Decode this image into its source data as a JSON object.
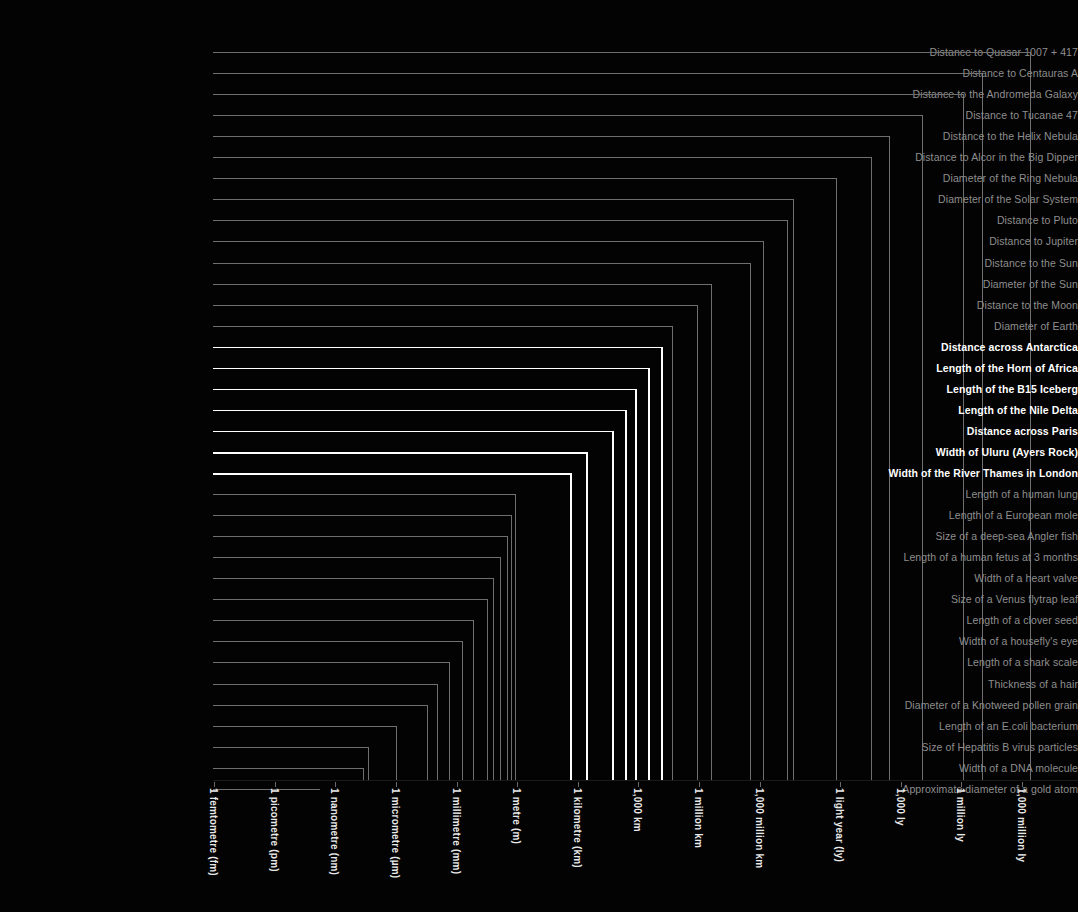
{
  "meta": {
    "background_color": "#000000",
    "dim_color": "#8e8e8e",
    "bold_color": "#ffffff"
  },
  "chart_data": {
    "type": "bar",
    "orientation": "vertical-dropline",
    "title": "",
    "subtitle": "",
    "xlabel": "",
    "ylabel": "",
    "scale": "log10",
    "grid": false,
    "legend_position": "none",
    "axis_ticks": [
      {
        "label": "1 femtometre (fm)",
        "exponent": -15
      },
      {
        "label": "1 picometre (pm)",
        "exponent": -12
      },
      {
        "label": "1 nanometre (nm)",
        "exponent": -9
      },
      {
        "label": "1 micrometre (µm)",
        "exponent": -6
      },
      {
        "label": "1 millimetre (mm)",
        "exponent": -3
      },
      {
        "label": "1 metre (m)",
        "exponent": 0
      },
      {
        "label": "1 kilometre (km)",
        "exponent": 3
      },
      {
        "label": "1,000 km",
        "exponent": 6
      },
      {
        "label": "1 million km",
        "exponent": 9
      },
      {
        "label": "1,000 million km",
        "exponent": 12
      },
      {
        "label": "1 light year (ly)",
        "exponent": 15.98
      },
      {
        "label": "1,000 ly",
        "exponent": 18.98
      },
      {
        "label": "1 million ly",
        "exponent": 21.98
      },
      {
        "label": "1,000 million ly",
        "exponent": 24.98
      }
    ],
    "categories": [
      "Distance to Quasar 1007 + 417",
      "Distance to Centauras A",
      "Distance to the Andromeda Galaxy",
      "Distance to Tucanae 47",
      "Distance to the Helix Nebula",
      "Distance to Alcor in the Big Dipper",
      "Diameter of the Ring Nebula",
      "Diameter of the Solar System",
      "Distance to Pluto",
      "Distance to Jupiter",
      "Distance to the Sun",
      "Diameter of the Sun",
      "Distance to the Moon",
      "Diameter of Earth",
      "Distance across Antarctica",
      "Length of the Horn of Africa",
      "Length of the B15 Iceberg",
      "Length of the Nile Delta",
      "Distance across Paris",
      "Width of Uluru (Ayers Rock)",
      "Width of the River Thames in London",
      "Length of a human lung",
      "Length of a European mole",
      "Size of a deep-sea Angler fish",
      "Length of a human fetus at 3 months",
      "Width of a heart valve",
      "Size of a Venus flytrap leaf",
      "Length of a clover seed",
      "Width of a housefly's eye",
      "Length of a shark scale",
      "Thickness of a hair",
      "Diameter of a Knotweed pollen grain",
      "Length of an E.coli bacterium",
      "Size of Hepatitis B virus particles",
      "Width of a DNA molecule",
      "Approximate diameter of a gold atom"
    ],
    "items": [
      {
        "label": "Distance to Quasar 1007 + 417",
        "x": 1030,
        "emphasis": "dim"
      },
      {
        "label": "Distance to Centauras A",
        "x": 982,
        "emphasis": "dim"
      },
      {
        "label": "Distance to the Andromeda Galaxy",
        "x": 963,
        "emphasis": "dim"
      },
      {
        "label": "Distance to Tucanae 47",
        "x": 922,
        "emphasis": "dim"
      },
      {
        "label": "Distance to the Helix Nebula",
        "x": 889,
        "emphasis": "dim"
      },
      {
        "label": "Distance to Alcor in the Big Dipper",
        "x": 871,
        "emphasis": "dim"
      },
      {
        "label": "Diameter of the Ring Nebula",
        "x": 836,
        "emphasis": "dim"
      },
      {
        "label": "Diameter of the Solar System",
        "x": 793,
        "emphasis": "dim"
      },
      {
        "label": "Distance to Pluto",
        "x": 787,
        "emphasis": "dim"
      },
      {
        "label": "Distance to Jupiter",
        "x": 763,
        "emphasis": "dim"
      },
      {
        "label": "Distance to the Sun",
        "x": 750,
        "emphasis": "dim"
      },
      {
        "label": "Diameter of the Sun",
        "x": 711,
        "emphasis": "dim"
      },
      {
        "label": "Distance to the Moon",
        "x": 697,
        "emphasis": "dim"
      },
      {
        "label": "Diameter of Earth",
        "x": 672,
        "emphasis": "dim"
      },
      {
        "label": "Distance across Antarctica",
        "x": 661,
        "emphasis": "bold"
      },
      {
        "label": "Length of the Horn of Africa",
        "x": 648,
        "emphasis": "bold"
      },
      {
        "label": "Length of the B15 Iceberg",
        "x": 635,
        "emphasis": "bold"
      },
      {
        "label": "Length of the Nile Delta",
        "x": 625,
        "emphasis": "bold"
      },
      {
        "label": "Distance across Paris",
        "x": 612,
        "emphasis": "bold"
      },
      {
        "label": "Width of Uluru (Ayers Rock)",
        "x": 586,
        "emphasis": "bold"
      },
      {
        "label": "Width of the River Thames in London",
        "x": 570,
        "emphasis": "bold"
      },
      {
        "label": "Length of a human lung",
        "x": 515,
        "emphasis": "dim"
      },
      {
        "label": "Length of a European mole",
        "x": 511,
        "emphasis": "dim"
      },
      {
        "label": "Size of a deep-sea Angler fish",
        "x": 507,
        "emphasis": "dim"
      },
      {
        "label": "Length of a human fetus at 3 months",
        "x": 500,
        "emphasis": "dim"
      },
      {
        "label": "Width of a heart valve",
        "x": 493,
        "emphasis": "dim"
      },
      {
        "label": "Size of a Venus flytrap leaf",
        "x": 487,
        "emphasis": "dim"
      },
      {
        "label": "Length of a clover seed",
        "x": 473,
        "emphasis": "dim"
      },
      {
        "label": "Width of a housefly's eye",
        "x": 462,
        "emphasis": "dim"
      },
      {
        "label": "Length of a shark scale",
        "x": 449,
        "emphasis": "dim"
      },
      {
        "label": "Thickness of a hair",
        "x": 437,
        "emphasis": "dim"
      },
      {
        "label": "Diameter of a Knotweed pollen grain",
        "x": 427,
        "emphasis": "dim"
      },
      {
        "label": "Length of an E.coli bacterium",
        "x": 396,
        "emphasis": "dim"
      },
      {
        "label": "Size of Hepatitis B virus particles",
        "x": 368,
        "emphasis": "dim"
      },
      {
        "label": "Width of a DNA molecule",
        "x": 363,
        "emphasis": "dim"
      },
      {
        "label": "Approximate diameter of a gold atom",
        "x": 320,
        "emphasis": "dim"
      }
    ]
  }
}
